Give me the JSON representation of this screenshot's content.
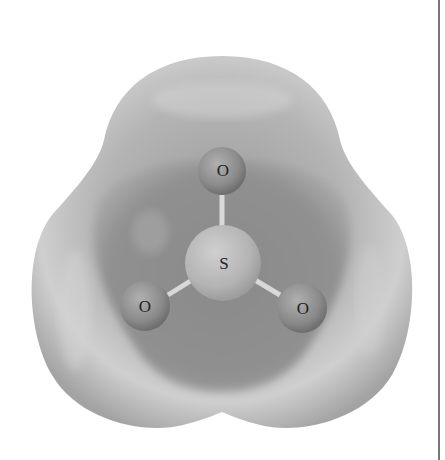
{
  "figure": {
    "molecule": "SO3",
    "atoms": [
      {
        "id": "o_top",
        "label": "O",
        "x": 222,
        "y": 171,
        "r": 24
      },
      {
        "id": "s_center",
        "label": "S",
        "x": 223,
        "y": 263,
        "r": 38
      },
      {
        "id": "o_left",
        "label": "O",
        "x": 145,
        "y": 306,
        "r": 25
      },
      {
        "id": "o_right",
        "label": "O",
        "x": 302,
        "y": 308,
        "r": 25
      }
    ],
    "colors": {
      "surface_light": "#c8c8c8",
      "surface_dark": "#8a8a8a",
      "interior": "#8e8e8e",
      "oxygen": "#8f8f8f",
      "sulfur": "#b9b9b9",
      "bond": "#d8d8d8",
      "rule": "#777777"
    }
  }
}
